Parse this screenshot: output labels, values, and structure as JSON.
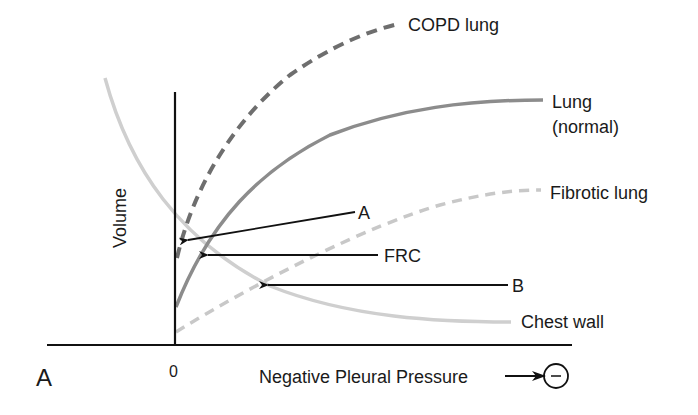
{
  "panel_label": "A",
  "axes": {
    "y_label": "Volume",
    "x_label": "Negative Pleural Pressure",
    "x_origin_label": "0",
    "x_direction_symbol": "−"
  },
  "curves": [
    {
      "id": "copd",
      "label": "COPD lung",
      "style": "dashed",
      "color": "#6e6e6e"
    },
    {
      "id": "normal",
      "label_line1": "Lung",
      "label_line2": "(normal)",
      "style": "solid",
      "color": "#8c8c8c"
    },
    {
      "id": "fibrotic",
      "label": "Fibrotic lung",
      "style": "dashed",
      "color": "#c8c8c8"
    },
    {
      "id": "chest_wall",
      "label": "Chest wall",
      "style": "solid",
      "color": "#cfcfcf"
    }
  ],
  "annotations": [
    {
      "id": "A",
      "label": "A",
      "points_to": "intersection of COPD lung and chest wall"
    },
    {
      "id": "FRC",
      "label": "FRC",
      "points_to": "intersection of normal lung and chest wall"
    },
    {
      "id": "B",
      "label": "B",
      "points_to": "intersection of fibrotic lung and chest wall"
    }
  ],
  "colors": {
    "axis": "#111111",
    "arrow": "#111111",
    "text": "#1a1a1a"
  }
}
